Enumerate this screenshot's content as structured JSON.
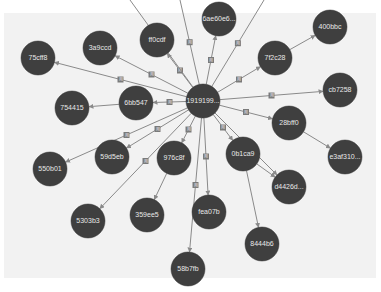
{
  "graph": {
    "center": "1919199...",
    "nodes": [
      {
        "id": "1919199...",
        "label": "1919199...",
        "role": "center"
      },
      {
        "id": "6ae60e6...",
        "label": "6ae60e6..."
      },
      {
        "id": "400bbc",
        "label": "400bbc"
      },
      {
        "id": "ff0cdf",
        "label": "ff0cdf"
      },
      {
        "id": "3a9ccd",
        "label": "3a9ccd"
      },
      {
        "id": "75cff8",
        "label": "75cff8"
      },
      {
        "id": "7f2c28",
        "label": "7f2c28"
      },
      {
        "id": "cb7258",
        "label": "cb7258"
      },
      {
        "id": "6bb547",
        "label": "6bb547"
      },
      {
        "id": "754415",
        "label": "754415"
      },
      {
        "id": "28bff0",
        "label": "28bff0"
      },
      {
        "id": "e3af310...",
        "label": "e3af310..."
      },
      {
        "id": "59d5eb",
        "label": "59d5eb"
      },
      {
        "id": "976c8f",
        "label": "976c8f"
      },
      {
        "id": "0b1ca9",
        "label": "0b1ca9"
      },
      {
        "id": "550b01",
        "label": "550b01"
      },
      {
        "id": "d4426d...",
        "label": "d4426d..."
      },
      {
        "id": "5303b3",
        "label": "5303b3"
      },
      {
        "id": "359ee5",
        "label": "359ee5"
      },
      {
        "id": "fea07b",
        "label": "fea07b"
      },
      {
        "id": "8444b6",
        "label": "8444b6"
      },
      {
        "id": "58b7fb",
        "label": "58b7fb"
      }
    ],
    "edges": [
      {
        "from": "1919199...",
        "to": "6ae60e6...",
        "label": "用"
      },
      {
        "from": "1919199...",
        "to": "ff0cdf",
        "label": "用"
      },
      {
        "from": "1919199...",
        "to": "3a9ccd",
        "label": "用"
      },
      {
        "from": "1919199...",
        "to": "75cff8",
        "label": "用"
      },
      {
        "from": "1919199...",
        "to": "7f2c28",
        "label": "用"
      },
      {
        "from": "7f2c28",
        "to": "400bbc",
        "label": ""
      },
      {
        "from": "1919199...",
        "to": "cb7258",
        "label": "用"
      },
      {
        "from": "1919199...",
        "to": "6bb547",
        "label": "用"
      },
      {
        "from": "6bb547",
        "to": "754415",
        "label": ""
      },
      {
        "from": "1919199...",
        "to": "28bff0",
        "label": "用"
      },
      {
        "from": "28bff0",
        "to": "e3af310...",
        "label": ""
      },
      {
        "from": "1919199...",
        "to": "59d5eb",
        "label": "用"
      },
      {
        "from": "1919199...",
        "to": "976c8f",
        "label": "用"
      },
      {
        "from": "1919199...",
        "to": "0b1ca9",
        "label": "用"
      },
      {
        "from": "0b1ca9",
        "to": "d4426d...",
        "label": ""
      },
      {
        "from": "0b1ca9",
        "to": "8444b6",
        "label": ""
      },
      {
        "from": "1919199...",
        "to": "550b01",
        "label": "用"
      },
      {
        "from": "1919199...",
        "to": "5303b3",
        "label": "用"
      },
      {
        "from": "976c8f",
        "to": "359ee5",
        "label": ""
      },
      {
        "from": "1919199...",
        "to": "fea07b",
        "label": "用"
      },
      {
        "from": "1919199...",
        "to": "58b7fb",
        "label": "用"
      },
      {
        "from": "1919199...",
        "to": "d4426d...",
        "label": "用"
      },
      {
        "from": "1919199...",
        "to": "offscreen-top-1",
        "label": "用"
      },
      {
        "from": "1919199...",
        "to": "offscreen-top-2",
        "label": "用"
      },
      {
        "from": "1919199...",
        "to": "offscreen-top-3",
        "label": "用"
      }
    ]
  },
  "colors": {
    "node_fill": "#3f3f3f",
    "node_text": "#e8e8e8",
    "edge": "#8a8a8a",
    "canvas_bg": "#f2f2f2"
  }
}
